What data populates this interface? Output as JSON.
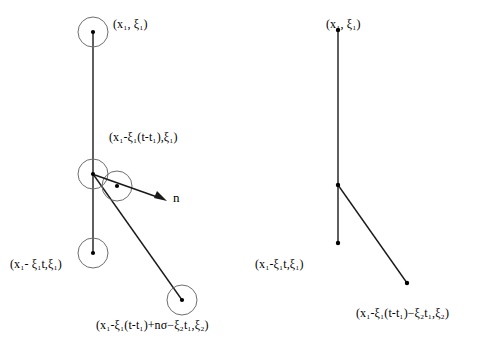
{
  "figure": {
    "width": 480,
    "height": 350,
    "background": "#ffffff",
    "stroke_color": "#1a1a1a",
    "text_color": "#000000"
  },
  "labels": {
    "left_top": "(x₁, ξ₁)",
    "left_middle": "(x₁-ξ₁(t-t₁),ξ₁)",
    "left_bottom_left": "(x₁- ξ₁t,ξ₁)",
    "left_bottom_right": "(x₁-ξ₁(t-t₁)+nσ−ξ₂t₁,ξ₂)",
    "normal_vector": "n",
    "right_top": "(x₁, ξ₁)",
    "right_bottom_left": "(x₁-ξ₁t,ξ₁)",
    "right_bottom_right": "(x₁-ξ₁(t-t₁)−ξ₂t₁,ξ₂)"
  },
  "label_positions": {
    "left_top": {
      "x": 113,
      "y": 18
    },
    "left_middle": {
      "x": 109,
      "y": 131
    },
    "left_bottom_left": {
      "x": 10,
      "y": 258
    },
    "left_bottom_right": {
      "x": 96,
      "y": 319
    },
    "normal_vector": {
      "x": 173,
      "y": 191
    },
    "right_top": {
      "x": 326,
      "y": 18
    },
    "right_bottom_left": {
      "x": 255,
      "y": 258
    },
    "right_bottom_right": {
      "x": 356,
      "y": 307
    }
  },
  "diagram_data": {
    "type": "diagram",
    "description": "Two billiard-style trajectory diagrams in phase space; left with collision spheres, right without",
    "left_panel": {
      "circles": [
        {
          "name": "top-sphere",
          "cx": 93,
          "cy": 32,
          "r": 15
        },
        {
          "name": "collision-sphere-a",
          "cx": 93,
          "cy": 174,
          "r": 15
        },
        {
          "name": "collision-sphere-b",
          "cx": 117,
          "cy": 186,
          "r": 15
        },
        {
          "name": "lower-sphere",
          "cx": 93,
          "cy": 253,
          "r": 15
        },
        {
          "name": "scattered-sphere",
          "cx": 182,
          "cy": 300,
          "r": 15
        }
      ],
      "points": [
        {
          "name": "top-point",
          "x": 93,
          "y": 32
        },
        {
          "name": "collision-point-a",
          "x": 93,
          "y": 174
        },
        {
          "name": "collision-point-b",
          "x": 117,
          "y": 186
        },
        {
          "name": "lower-point",
          "x": 93,
          "y": 253
        },
        {
          "name": "scattered-point",
          "x": 182,
          "y": 300
        }
      ],
      "segments": [
        {
          "name": "vertical-trajectory",
          "x1": 93,
          "y1": 32,
          "x2": 93,
          "y2": 253
        },
        {
          "name": "scattered-trajectory",
          "x1": 93,
          "y1": 174,
          "x2": 182,
          "y2": 300
        }
      ],
      "arrows": [
        {
          "name": "normal-vector-arrow",
          "x1": 95,
          "y1": 175,
          "x2": 167,
          "y2": 201
        }
      ]
    },
    "right_panel": {
      "points": [
        {
          "name": "top-point",
          "x": 338,
          "y": 30
        },
        {
          "name": "vertex-point",
          "x": 338,
          "y": 185
        },
        {
          "name": "lower-point",
          "x": 338,
          "y": 243
        },
        {
          "name": "branch-end-point",
          "x": 407,
          "y": 283
        }
      ],
      "segments": [
        {
          "name": "vertical-trajectory",
          "x1": 338,
          "y1": 30,
          "x2": 338,
          "y2": 243
        },
        {
          "name": "branch-trajectory",
          "x1": 338,
          "y1": 185,
          "x2": 407,
          "y2": 283
        }
      ]
    }
  }
}
